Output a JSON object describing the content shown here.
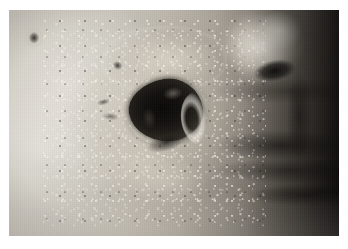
{
  "image": {
    "kind": "clinical-photograph",
    "title": "Clinical close-up photograph",
    "caption": "",
    "width_px": 348,
    "height_px": 249,
    "border": {
      "color": "#ffffff",
      "left_px": 9,
      "top_px": 10,
      "right_px": 9,
      "bottom_px": 13
    },
    "plate": {
      "width_px": 330,
      "height_px": 226
    }
  },
  "scene": {
    "subject": "infant / young child facial skin",
    "view": "close-up of left cheek, nose and mouth partly visible at right",
    "lighting": "direct flash from upper left; right side falls into shadow",
    "color_character": "near-monochrome with a faint warm cast",
    "regions": [
      {
        "id": "cheek",
        "label": "Cheek skin",
        "description": "Pale, brightly lit cheek occupying the left two-thirds of the frame",
        "tone_hex": "#cfcbc3"
      },
      {
        "id": "crusted-plaque",
        "label": "Crusted vesicular plaque",
        "description": "Broad area of crusting, scaling and small glistening vesicles surrounding the ulcer",
        "tone_hex": "#d4cec2"
      },
      {
        "id": "central-ulcer",
        "label": "Central necrotic ulcer with eschar",
        "description": "Large dark, irregular crater with black necrotic base and a raised pale rolled rim on its right side",
        "tone_hex": "#12100e"
      },
      {
        "id": "ulcer-rim",
        "label": "Rolled pale ulcer margin",
        "description": "Whitish macerated border highlighted along the lateral edge of the crater",
        "tone_hex": "#f0ede5"
      },
      {
        "id": "satellite-lesion",
        "label": "Small satellite lesion",
        "description": "Tiny dark crusted papule near the upper-left corner",
        "tone_hex": "#18150f"
      },
      {
        "id": "nose",
        "label": "Nose",
        "description": "Brightly lit nasal tip and ala at upper right with a dark nostril slit",
        "tone_hex": "#fbf7ee"
      },
      {
        "id": "nostril",
        "label": "Nostril",
        "description": "Dark oblique nasal opening",
        "tone_hex": "#0a0908"
      },
      {
        "id": "mouth",
        "label": "Mouth and lips",
        "description": "Shadowed lip folds running diagonally across the lower-right quadrant",
        "tone_hex": "#2a2621"
      },
      {
        "id": "background-dark",
        "label": "Shadowed background",
        "description": "Dark band of hair and background along the right edge",
        "tone_hex": "#141211"
      },
      {
        "id": "jaw-highlight",
        "label": "Jaw / bedding highlight",
        "description": "Bright diagonal band of light across the lower-left corner",
        "tone_hex": "#fdfcf8"
      }
    ]
  },
  "palette": {
    "page_background": "#ffffff",
    "skin_light": "#d3cfc7",
    "skin_mid": "#aea89f",
    "skin_shadow": "#4e4942",
    "eschar_black": "#0a0908",
    "rim_white": "#f4f1e9",
    "background_dark": "#141211"
  }
}
